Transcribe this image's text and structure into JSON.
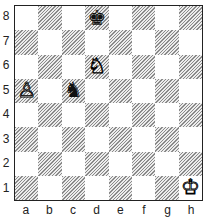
{
  "board": {
    "orientation": "white-bottom",
    "ranks": [
      "8",
      "7",
      "6",
      "5",
      "4",
      "3",
      "2",
      "1"
    ],
    "files": [
      "a",
      "b",
      "c",
      "d",
      "e",
      "f",
      "g",
      "h"
    ],
    "pieces": [
      {
        "square": "d8",
        "color": "black",
        "type": "king",
        "glyph": "♚"
      },
      {
        "square": "d6",
        "color": "white",
        "type": "knight",
        "glyph": "♘"
      },
      {
        "square": "a5",
        "color": "white",
        "type": "pawn",
        "glyph": "♙"
      },
      {
        "square": "c5",
        "color": "black",
        "type": "knight",
        "glyph": "♞"
      },
      {
        "square": "h1",
        "color": "white",
        "type": "king",
        "glyph": "♔"
      }
    ],
    "colors": {
      "light": "#ffffff",
      "dark": "#9a9a9a hatched",
      "border": "#222222"
    }
  }
}
